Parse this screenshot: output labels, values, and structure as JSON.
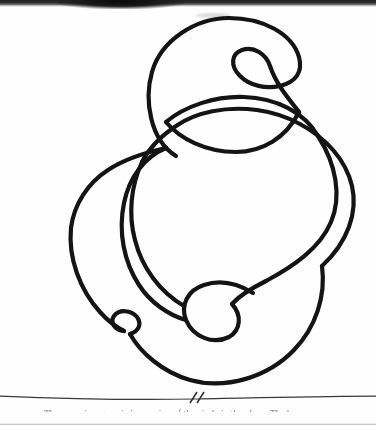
{
  "page": {
    "kind": "scanned-book-page",
    "background_color": "#fefefe",
    "ink_color": "#141414",
    "width": 376,
    "height": 425
  },
  "figure": {
    "title": "",
    "stroke_color": "#141414",
    "stroke_width": 4.2,
    "loop_count": 4,
    "crossing_count": 7,
    "loops": [
      {
        "name": "upper-large-loop",
        "cx": 224,
        "cy": 88,
        "rx": 76,
        "ry": 70
      },
      {
        "name": "upper-small-loop",
        "cx": 248,
        "cy": 70,
        "rx": 20,
        "ry": 20
      },
      {
        "name": "lower-large-loop",
        "cx": 196,
        "cy": 272,
        "rx": 128,
        "ry": 112
      },
      {
        "name": "bottom-center-loop",
        "cx": 213,
        "cy": 311,
        "rx": 29,
        "ry": 28
      },
      {
        "name": "bottom-left-loop",
        "cx": 127,
        "cy": 327,
        "rx": 15,
        "ry": 13
      }
    ]
  },
  "rule": {
    "name": "horizontal-rule-with-break",
    "y": 398,
    "break_symbol": "//",
    "break_x": 197
  },
  "caption": {
    "text": "The curve is a generic immersion of the circle in the plane. The br"
  },
  "artifacts": {
    "top_band_label": "scanner edge shadow",
    "bottom_band_label": "page edge shadow"
  }
}
